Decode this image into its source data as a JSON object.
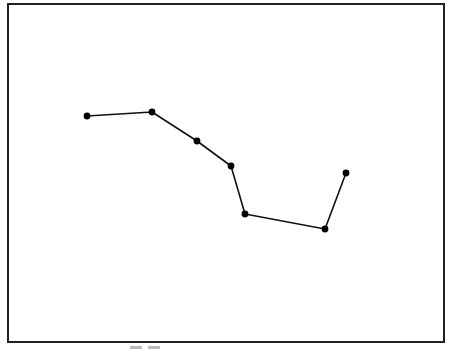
{
  "figure": {
    "frame": {
      "x": 8,
      "y": 4,
      "width": 436,
      "height": 338,
      "stroke": "#222222"
    },
    "line_color": "#111111",
    "marker_color": "#000000"
  },
  "chart_data": {
    "type": "line",
    "title": "",
    "xlabel": "",
    "ylabel": "",
    "grid": false,
    "legend": null,
    "axes_visible": false,
    "coordinate_space": "pixel (frame-relative, origin top-left of image)",
    "series": [
      {
        "name": "polyline",
        "points": [
          {
            "x": 87,
            "y": 116
          },
          {
            "x": 152,
            "y": 112
          },
          {
            "x": 197,
            "y": 141
          },
          {
            "x": 231,
            "y": 166
          },
          {
            "x": 245,
            "y": 214
          },
          {
            "x": 325,
            "y": 229
          },
          {
            "x": 346,
            "y": 173
          }
        ]
      }
    ]
  }
}
